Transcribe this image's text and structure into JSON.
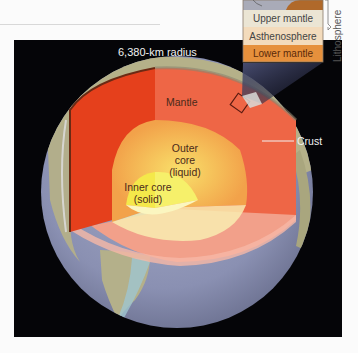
{
  "diagram": {
    "title": "6,380-km radius",
    "layers": {
      "mantle": "Mantle",
      "outer_core_line1": "Outer",
      "outer_core_line2": "core",
      "outer_core_line3": "(liquid)",
      "inner_core_line1": "Inner core",
      "inner_core_line2": "(solid)",
      "crust": "Crust"
    },
    "inset": {
      "layers": [
        "Upper mantle",
        "Asthenosphere",
        "Lower mantle"
      ],
      "bracket_label": "Lithosphere"
    },
    "colors": {
      "background": "#050508",
      "mantle_left": "#e8401c",
      "mantle_right": "#ef6a4a",
      "mantle_bottom": "#f4a592",
      "outer_core": "#f5b94a",
      "inner_core": "#f2ef3a",
      "ocean": "#8c92b8",
      "land": "#b8b48a",
      "inset_upper_mantle": "#ece6d6",
      "inset_asthenosphere": "#f3dcbd",
      "inset_lower_mantle": "#e8903e",
      "inset_crust": "#b06a2a"
    }
  }
}
